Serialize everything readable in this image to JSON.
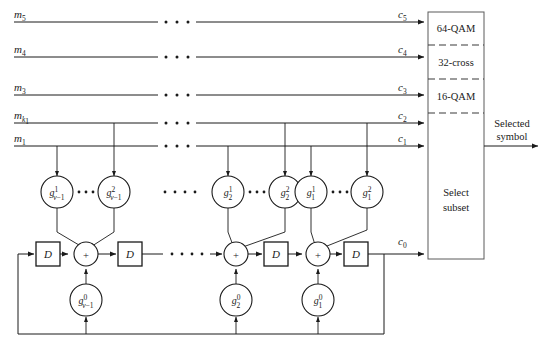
{
  "figure": {
    "background": "#ffffff",
    "line_color": "#1a1a1a"
  },
  "inputs": {
    "label": "message bit lines",
    "lines": [
      {
        "name": "m5",
        "base": "m",
        "sub": "5",
        "y": 22
      },
      {
        "name": "m4",
        "base": "m",
        "sub": "4",
        "y": 57
      },
      {
        "name": "m3",
        "base": "m",
        "sub": "3",
        "y": 95
      },
      {
        "name": "mk1",
        "base": "m",
        "sub": "k1",
        "y": 123
      },
      {
        "name": "m1",
        "base": "m",
        "sub": "1",
        "y": 146
      }
    ]
  },
  "outputs": {
    "label": "coded bit lines",
    "lines": [
      {
        "name": "c5",
        "base": "c",
        "sub": "5"
      },
      {
        "name": "c4",
        "base": "c",
        "sub": "4"
      },
      {
        "name": "c3",
        "base": "c",
        "sub": "3"
      },
      {
        "name": "c2",
        "base": "c",
        "sub": "2"
      },
      {
        "name": "c1",
        "base": "c",
        "sub": "1"
      },
      {
        "name": "c0",
        "base": "c",
        "sub": "0"
      }
    ]
  },
  "select_subset": {
    "title_line1": "Select",
    "title_line2": "subset",
    "partitions": [
      {
        "name": "64-QAM",
        "label": "64-QAM"
      },
      {
        "name": "32-cross",
        "label": "32-cross"
      },
      {
        "name": "16-QAM",
        "label": "16-QAM"
      }
    ],
    "output_label_line1": "Selected",
    "output_label_line2": "symbol"
  },
  "stages": [
    {
      "name": "stage-nu-minus-1",
      "index_sub": "ν − 1",
      "taps": [
        {
          "name": "g-nu-1-sup1",
          "base": "g",
          "sup": "1",
          "sub": "ν − 1"
        },
        {
          "name": "g-nu-1-sup2",
          "base": "g",
          "sup": "2",
          "sub": "ν − 1"
        }
      ],
      "feedback_tap": {
        "name": "g-nu-1-sup0",
        "base": "g",
        "sup": "0",
        "sub": "ν − 1"
      },
      "adder": "+",
      "delay": "D"
    },
    {
      "name": "stage-2",
      "index_sub": "2",
      "taps": [
        {
          "name": "g-2-sup1",
          "base": "g",
          "sup": "1",
          "sub": "2"
        },
        {
          "name": "g-2-sup2",
          "base": "g",
          "sup": "2",
          "sub": "2"
        }
      ],
      "feedback_tap": {
        "name": "g-2-sup0",
        "base": "g",
        "sup": "0",
        "sub": "2"
      },
      "adder": "+",
      "delay": "D"
    },
    {
      "name": "stage-1",
      "index_sub": "1",
      "taps": [
        {
          "name": "g-1-sup1",
          "base": "g",
          "sup": "1",
          "sub": "1"
        },
        {
          "name": "g-1-sup2",
          "base": "g",
          "sup": "2",
          "sub": "1"
        }
      ],
      "feedback_tap": {
        "name": "g-1-sup0",
        "base": "g",
        "sup": "0",
        "sub": "1"
      },
      "adder": "+",
      "delay": "D"
    }
  ],
  "symbols": {
    "adder": "+",
    "delay": "D",
    "ellipsis_dots": 3
  }
}
